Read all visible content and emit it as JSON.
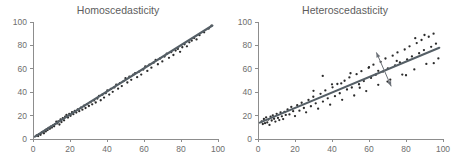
{
  "figure": {
    "background_color": "#ffffff",
    "point_color": "#2b2b2b",
    "line_color": "#555f66",
    "axis_color": "#8d8d8d",
    "title_color": "#5d5d5d",
    "arrow_color": "#6b7077"
  },
  "chart_data": [
    {
      "type": "scatter",
      "title": "Homoscedasticity",
      "xlabel": "",
      "ylabel": "",
      "xlim": [
        0,
        100
      ],
      "ylim": [
        0,
        100
      ],
      "xticks": [
        0,
        20,
        40,
        60,
        80,
        100
      ],
      "yticks": [
        0,
        20,
        40,
        60,
        80,
        100
      ],
      "xticklabels": [
        "0",
        "20",
        "40",
        "60",
        "80",
        "100"
      ],
      "yticklabels": [
        "0",
        "20",
        "40",
        "60",
        "80",
        "100"
      ],
      "grid": false,
      "legend": "none",
      "fit_line": {
        "x": [
          1,
          97
        ],
        "y": [
          2,
          97
        ]
      },
      "annotations": [],
      "x": [
        2.0,
        2.8,
        3.4,
        4.1,
        4.7,
        5.2,
        5.9,
        6.4,
        6.9,
        7.3,
        7.9,
        8.4,
        9.1,
        9.6,
        10.2,
        10.9,
        11.4,
        12.0,
        12.6,
        13.1,
        13.7,
        14.3,
        14.9,
        15.4,
        16.1,
        16.8,
        17.4,
        18.1,
        18.9,
        19.6,
        20.3,
        21.1,
        21.8,
        22.6,
        23.4,
        24.2,
        25.0,
        25.9,
        26.7,
        27.6,
        28.4,
        29.3,
        30.2,
        31.1,
        32.0,
        33.0,
        33.9,
        34.8,
        35.7,
        36.6,
        37.5,
        38.4,
        39.3,
        40.2,
        41.2,
        42.1,
        43.1,
        44.0,
        45.0,
        46.0,
        47.0,
        48.0,
        49.0,
        50.0,
        51.0,
        52.1,
        53.1,
        54.2,
        55.2,
        56.3,
        57.4,
        58.5,
        59.6,
        60.7,
        61.8,
        62.9,
        64.0,
        65.2,
        66.3,
        67.5,
        68.7,
        69.9,
        71.1,
        72.3,
        73.5,
        74.7,
        75.9,
        77.1,
        78.3,
        79.5,
        80.7,
        81.9,
        83.2,
        84.5,
        85.8,
        87.1,
        88.4,
        90.0,
        92.5,
        95.0,
        96.5
      ],
      "y": [
        3.0,
        2.5,
        4.2,
        3.6,
        5.4,
        6.1,
        4.9,
        7.2,
        6.5,
        8.3,
        7.6,
        9.4,
        8.7,
        10.5,
        9.8,
        11.6,
        10.9,
        12.7,
        14.8,
        13.3,
        15.1,
        12.4,
        16.7,
        14.5,
        17.8,
        16.0,
        19.1,
        20.6,
        18.3,
        21.4,
        19.8,
        22.9,
        21.2,
        24.1,
        22.6,
        25.3,
        23.8,
        26.9,
        25.1,
        28.4,
        26.5,
        29.8,
        28.2,
        31.5,
        29.6,
        33.0,
        31.2,
        34.6,
        36.8,
        33.1,
        37.9,
        35.4,
        39.2,
        41.6,
        38.0,
        42.8,
        40.3,
        44.1,
        46.5,
        43.0,
        47.8,
        45.2,
        49.5,
        52.0,
        48.3,
        53.2,
        50.6,
        54.9,
        56.3,
        52.8,
        57.6,
        55.1,
        59.4,
        62.0,
        58.2,
        63.5,
        61.0,
        65.2,
        67.6,
        63.9,
        68.8,
        66.3,
        70.5,
        72.9,
        69.4,
        74.2,
        71.8,
        75.6,
        77.0,
        74.5,
        78.4,
        81.0,
        79.2,
        82.6,
        84.0,
        86.3,
        85.1,
        88.7,
        91.2,
        94.4,
        96.8
      ]
    },
    {
      "type": "scatter",
      "title": "Heteroscedasticity",
      "xlabel": "",
      "ylabel": "",
      "xlim": [
        0,
        100
      ],
      "ylim": [
        0,
        100
      ],
      "xticks": [
        0,
        20,
        40,
        60,
        80,
        100
      ],
      "yticks": [
        0,
        20,
        40,
        60,
        80,
        100
      ],
      "xticklabels": [
        "0",
        "20",
        "40",
        "60",
        "80",
        "100"
      ],
      "yticklabels": [
        "0",
        "20",
        "40",
        "60",
        "80",
        "100"
      ],
      "grid": false,
      "legend": "none",
      "fit_line": {
        "x": [
          1,
          98
        ],
        "y": [
          14,
          78
        ]
      },
      "annotations": [
        {
          "name": "spread-arrow",
          "type": "double-headed-arrow",
          "x1": 72.0,
          "y1": 45.0,
          "x2": 64.0,
          "y2": 74.0,
          "meaning": "increasing variance"
        }
      ],
      "x": [
        2.0,
        2.6,
        3.2,
        3.8,
        4.4,
        5.0,
        5.6,
        6.2,
        6.8,
        7.4,
        8.0,
        8.7,
        9.4,
        10.1,
        10.8,
        11.5,
        12.2,
        12.9,
        13.6,
        14.3,
        15.0,
        16.0,
        17.0,
        18.0,
        19.0,
        20.0,
        21.2,
        22.4,
        23.6,
        24.8,
        26.0,
        27.3,
        28.6,
        29.9,
        31.2,
        32.5,
        33.8,
        35.1,
        36.4,
        37.7,
        39.0,
        40.3,
        41.6,
        42.9,
        44.2,
        45.5,
        46.8,
        48.1,
        49.4,
        50.7,
        52.0,
        53.3,
        54.6,
        55.9,
        57.2,
        58.5,
        59.8,
        61.1,
        62.4,
        63.7,
        65.0,
        66.3,
        67.6,
        68.9,
        70.2,
        71.5,
        72.8,
        74.1,
        75.4,
        76.7,
        78.0,
        79.3,
        80.6,
        81.9,
        83.2,
        84.5,
        85.8,
        87.1,
        88.4,
        89.7,
        91.0,
        92.3,
        93.6,
        94.9,
        96.2,
        97.5,
        45.0,
        50.0,
        55.0,
        60.0,
        65.0,
        70.0,
        75.0,
        80.0,
        85.0,
        90.0,
        95.0,
        35.0,
        40.0,
        30.0
      ],
      "y": [
        15.0,
        12.8,
        17.1,
        13.5,
        18.4,
        14.2,
        16.6,
        12.0,
        19.0,
        15.8,
        20.2,
        17.3,
        14.9,
        21.5,
        18.0,
        16.2,
        22.8,
        19.4,
        17.0,
        23.1,
        20.6,
        25.3,
        21.0,
        27.4,
        23.8,
        19.6,
        28.9,
        24.2,
        31.0,
        26.5,
        22.8,
        33.4,
        28.0,
        36.1,
        30.5,
        25.9,
        38.6,
        32.0,
        41.5,
        34.8,
        29.3,
        44.2,
        36.6,
        47.0,
        39.1,
        33.5,
        49.8,
        42.3,
        52.6,
        44.0,
        37.2,
        55.4,
        46.8,
        58.0,
        49.5,
        41.0,
        60.8,
        52.2,
        63.5,
        54.9,
        46.3,
        66.0,
        57.6,
        68.8,
        60.3,
        50.7,
        71.2,
        62.9,
        74.0,
        65.4,
        55.1,
        76.5,
        68.0,
        79.2,
        70.6,
        59.5,
        82.0,
        73.3,
        84.6,
        76.0,
        64.2,
        87.4,
        78.8,
        90.0,
        81.5,
        68.9,
        47.5,
        56.2,
        43.8,
        61.4,
        58.3,
        49.1,
        66.7,
        54.5,
        86.2,
        88.9,
        64.8,
        53.9,
        46.7,
        41.2
      ]
    }
  ]
}
